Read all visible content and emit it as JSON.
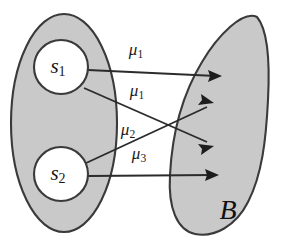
{
  "figure": {
    "background_color": "#ffffff",
    "region_fill_color": "#c9c9c9",
    "outline_color": "#3a3a3a",
    "edge_color": "#2b2b2b",
    "text_color": "#161616",
    "width": 282,
    "height": 247
  },
  "source_region": {
    "name": "source-region",
    "shape": "ellipse",
    "cx": 64,
    "cy": 123,
    "rx": 54,
    "ry": 110
  },
  "nodes": [
    {
      "id": "s1",
      "label": "s",
      "subscript": "1",
      "cx": 61,
      "cy": 67,
      "r": 27
    },
    {
      "id": "s2",
      "label": "s",
      "subscript": "2",
      "cx": 61,
      "cy": 174,
      "r": 27
    }
  ],
  "target_region": {
    "name": "target-region-B",
    "label": "B",
    "label_x": 228,
    "label_y": 213
  },
  "edges": [
    {
      "id": "edge-1",
      "from": "s1",
      "to": "target-region-B",
      "label": "μ",
      "subscript": "1",
      "label_x": 136,
      "label_y": 51,
      "x1": 88,
      "y1": 70,
      "x2": 221,
      "y2": 76
    },
    {
      "id": "edge-2",
      "from": "s1",
      "to": "target-region-B",
      "label": "μ",
      "subscript": "1",
      "label_x": 137,
      "label_y": 92,
      "x1": 84,
      "y1": 88,
      "x2": 212,
      "y2": 145
    },
    {
      "id": "edge-3",
      "from": "s2",
      "to": "target-region-B",
      "label": "μ",
      "subscript": "2",
      "label_x": 128,
      "label_y": 131,
      "x1": 84,
      "y1": 164,
      "x2": 212,
      "y2": 104
    },
    {
      "id": "edge-4",
      "from": "s2",
      "to": "target-region-B",
      "label": "μ",
      "subscript": "3",
      "label_x": 139,
      "label_y": 155,
      "x1": 88,
      "y1": 176,
      "x2": 218,
      "y2": 175
    }
  ]
}
